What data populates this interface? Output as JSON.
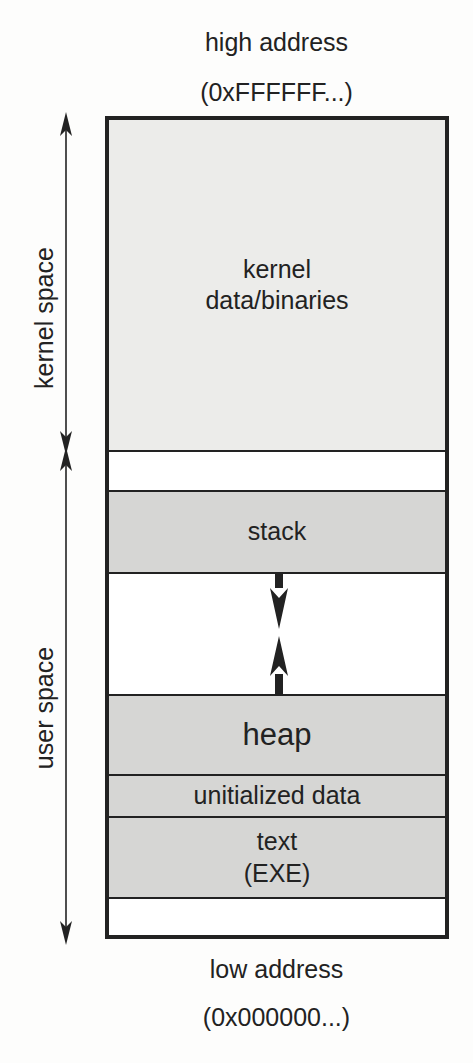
{
  "top_label": {
    "line1": "high address",
    "line2": "(0xFFFFFF...)"
  },
  "bottom_label": {
    "line1": "low address",
    "line2": "(0x000000...)"
  },
  "side_labels": {
    "kernel": "kernel space",
    "user": "user space"
  },
  "segments": [
    {
      "id": "kernel",
      "line1": "kernel",
      "line2": "data/binaries",
      "fill": "#ececea"
    },
    {
      "id": "gap1",
      "line1": "",
      "line2": "",
      "fill": "#ffffff"
    },
    {
      "id": "stack",
      "line1": "stack",
      "line2": "",
      "fill": "#d6d6d4"
    },
    {
      "id": "free",
      "line1": "",
      "line2": "",
      "fill": "#ffffff"
    },
    {
      "id": "heap",
      "line1": "heap",
      "line2": "",
      "fill": "#d6d6d4"
    },
    {
      "id": "bss",
      "line1": "unitialized data",
      "line2": "",
      "fill": "#d6d6d4"
    },
    {
      "id": "text",
      "line1": "text",
      "line2": "(EXE)",
      "fill": "#d6d6d4"
    },
    {
      "id": "gap2",
      "line1": "",
      "line2": "",
      "fill": "#ffffff"
    }
  ],
  "colors": {
    "line": "#222222",
    "kernel_fill": "#ececea",
    "user_fill": "#d6d6d4"
  }
}
